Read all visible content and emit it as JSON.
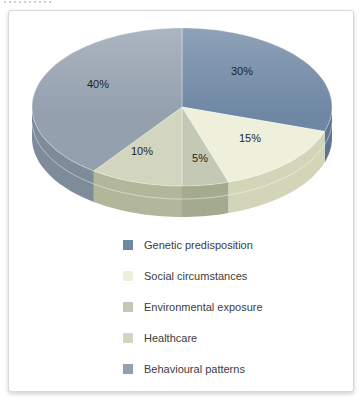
{
  "card": {
    "border_color": "#d8d8d8",
    "background": "#ffffff"
  },
  "chart_data": {
    "type": "pie",
    "style": "3d",
    "legend_position": "bottom",
    "slices": [
      {
        "label": "Genetic predisposition",
        "value": 30,
        "display": "30%",
        "color": "#6e87a3",
        "side_color": "#5d7590",
        "label_pos": {
          "x": 233,
          "y": 60
        }
      },
      {
        "label": "Social circumstances",
        "value": 15,
        "display": "15%",
        "color": "#eef0dc",
        "side_color": "#d2d5b8",
        "label_pos": {
          "x": 241,
          "y": 127
        }
      },
      {
        "label": "Environmental exposure",
        "value": 5,
        "display": "5%",
        "color": "#c3c9b5",
        "side_color": "#a4aa90",
        "label_pos": {
          "x": 191,
          "y": 147
        }
      },
      {
        "label": "Healthcare",
        "value": 10,
        "display": "10%",
        "color": "#d2d6be",
        "side_color": "#b2b69b",
        "label_pos": {
          "x": 133,
          "y": 140
        }
      },
      {
        "label": "Behavioural patterns",
        "value": 40,
        "display": "40%",
        "color": "#94a0ae",
        "side_color": "#7e8b99",
        "label_pos": {
          "x": 89,
          "y": 73
        }
      }
    ]
  }
}
